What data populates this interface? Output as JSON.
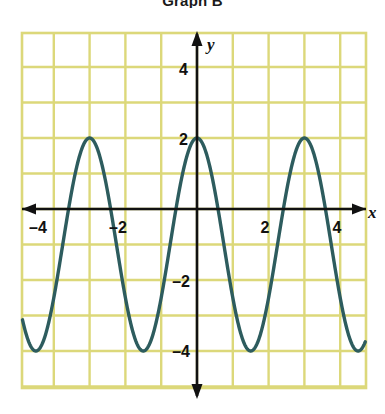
{
  "title": "Graph B",
  "chart_data": {
    "type": "line",
    "title": "Graph B",
    "xlabel": "x",
    "ylabel": "y",
    "xlim": [
      -4.875,
      4.7
    ],
    "ylim": [
      -5.0,
      5.1
    ],
    "x_ticks": [
      -4,
      -2,
      2,
      4
    ],
    "y_ticks": [
      4,
      2,
      -2,
      -4
    ],
    "x_tick_labels": [
      "–4",
      "–2",
      "2",
      "4"
    ],
    "y_tick_labels": [
      "4",
      "2",
      "–2",
      "–4"
    ],
    "grid": true,
    "grid_step": 1,
    "grid_color": "#dcd87a",
    "axis_color": "#111111",
    "curve_color": "#2d5c5e",
    "legend": null,
    "function": "y = 3 cos(2πx/3) – 1",
    "amplitude": 3,
    "period": 3,
    "midline": -1,
    "maximum": 2,
    "minimum": -4,
    "maxima_x": [
      -3,
      0,
      3
    ],
    "minima_x": [
      -4.5,
      -1.5,
      1.5,
      4.5
    ],
    "series": [
      {
        "name": "y = 3 cos(2πx/3) – 1",
        "x": [
          -4.875,
          -4.75,
          -4.5,
          -4.25,
          -4,
          -3.75,
          -3.5,
          -3.25,
          -3,
          -2.75,
          -2.5,
          -2.25,
          -2,
          -1.75,
          -1.5,
          -1.25,
          -1,
          -0.75,
          -0.5,
          -0.25,
          0,
          0.25,
          0.5,
          0.75,
          1,
          1.25,
          1.5,
          1.75,
          2,
          2.25,
          2.5,
          2.75,
          3,
          3.25,
          3.5,
          3.75,
          4,
          4.25,
          4.5,
          4.7
        ],
        "y": [
          -3.9,
          -3.96,
          -4,
          -3.85,
          -3.5,
          -2.85,
          -2.06,
          -1.06,
          2,
          -1.06,
          -2.06,
          -2.85,
          -3.5,
          -3.85,
          -4,
          -3.85,
          -3.5,
          -2.85,
          -2.06,
          -1.06,
          2,
          -1.06,
          -2.06,
          -2.85,
          -3.5,
          -3.85,
          -4,
          -3.85,
          -3.5,
          -2.85,
          -2.06,
          -1.06,
          2,
          -1.06,
          -2.06,
          -2.85,
          -3.5,
          -3.85,
          -4,
          -3.97
        ]
      }
    ]
  },
  "axes": {
    "x_label": "x",
    "y_label": "y"
  },
  "ticks": {
    "x": [
      {
        "label": "–4",
        "value": -4
      },
      {
        "label": "–2",
        "value": -2
      },
      {
        "label": "2",
        "value": 2
      },
      {
        "label": "4",
        "value": 4
      }
    ],
    "y": [
      {
        "label": "4",
        "value": 4
      },
      {
        "label": "2",
        "value": 2
      },
      {
        "label": "–2",
        "value": -2
      },
      {
        "label": "–4",
        "value": -4
      }
    ]
  }
}
